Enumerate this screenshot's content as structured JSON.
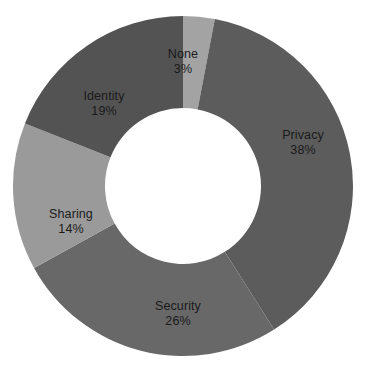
{
  "chart_data": {
    "type": "pie",
    "variant": "donut",
    "title": "",
    "subtitle": "",
    "xlabel": "",
    "ylabel": "",
    "grid": false,
    "legend": "none",
    "labels_inside_slices": true,
    "value_unit": "%",
    "start_angle_deg": 0,
    "direction": "clockwise",
    "inner_radius_ratio": 0.46,
    "categories": [
      "None",
      "Privacy",
      "Security",
      "Sharing",
      "Identity"
    ],
    "values": [
      3,
      38,
      26,
      14,
      19
    ],
    "slices": [
      {
        "name": "None",
        "value": 3,
        "value_text": "3%",
        "color": "#a3a3a3",
        "start_angle_deg": 0,
        "end_angle_deg": 10.8,
        "label_x": 183,
        "label_y": 62
      },
      {
        "name": "Privacy",
        "value": 38,
        "value_text": "38%",
        "color": "#5c5c5c",
        "start_angle_deg": 10.8,
        "end_angle_deg": 147.6,
        "label_x": 303,
        "label_y": 143
      },
      {
        "name": "Security",
        "value": 26,
        "value_text": "26%",
        "color": "#686868",
        "start_angle_deg": 147.6,
        "end_angle_deg": 241.2,
        "label_x": 178,
        "label_y": 314
      },
      {
        "name": "Sharing",
        "value": 14,
        "value_text": "14%",
        "color": "#9a9a9a",
        "start_angle_deg": 241.2,
        "end_angle_deg": 291.6,
        "label_x": 71,
        "label_y": 222
      },
      {
        "name": "Identity",
        "value": 19,
        "value_text": "19%",
        "color": "#535353",
        "start_angle_deg": 291.6,
        "end_angle_deg": 360,
        "label_x": 104,
        "label_y": 104
      }
    ],
    "geometry": {
      "center_x": 183,
      "center_y": 186,
      "outer_radius": 170,
      "inner_radius": 78
    },
    "colors": {
      "background": "#ffffff",
      "hole": "#ffffff",
      "label_text": "#1a1a1a"
    }
  }
}
